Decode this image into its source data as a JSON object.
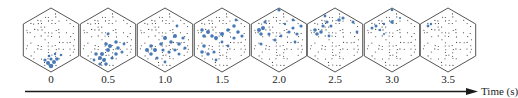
{
  "figure": {
    "axis": {
      "label": "Time (s)",
      "arrow_color": "#1a1a1a"
    },
    "colors": {
      "hex_outline": "#555555",
      "grid_dot": "#333333",
      "activation": "#3a6fb0"
    },
    "frames": [
      {
        "time_label": "0",
        "cx": 51,
        "blobs": [
          [
            0,
            26,
            2.2
          ],
          [
            -3,
            23,
            2
          ],
          [
            3,
            22,
            2
          ],
          [
            -6,
            20,
            1.6
          ],
          [
            6,
            19,
            1.8
          ],
          [
            0,
            19,
            1.6
          ],
          [
            -2,
            16,
            1.3
          ],
          [
            10,
            15,
            1.3
          ],
          [
            4,
            14,
            1.2
          ]
        ]
      },
      {
        "time_label": "0.5",
        "cx": 108,
        "blobs": [
          [
            -8,
            18,
            2
          ],
          [
            -4,
            20,
            2
          ],
          [
            -12,
            14,
            1.8
          ],
          [
            -6,
            14,
            2
          ],
          [
            0,
            10,
            2
          ],
          [
            2,
            6,
            2
          ],
          [
            -2,
            4,
            1.8
          ],
          [
            8,
            2,
            1.8
          ],
          [
            10,
            8,
            1.8
          ],
          [
            8,
            14,
            1.8
          ],
          [
            14,
            12,
            1.5
          ],
          [
            4,
            18,
            1.6
          ],
          [
            -2,
            24,
            1.8
          ],
          [
            -8,
            24,
            1.6
          ],
          [
            0,
            -6,
            1.4
          ],
          [
            -14,
            20,
            1.4
          ],
          [
            16,
            4,
            1.4
          ]
        ]
      },
      {
        "time_label": "1.0",
        "cx": 165,
        "blobs": [
          [
            -18,
            10,
            2
          ],
          [
            -14,
            6,
            1.8
          ],
          [
            -10,
            10,
            2
          ],
          [
            -14,
            14,
            1.8
          ],
          [
            -8,
            18,
            1.6
          ],
          [
            -4,
            4,
            1.8
          ],
          [
            0,
            -2,
            2
          ],
          [
            6,
            2,
            1.8
          ],
          [
            10,
            -4,
            2
          ],
          [
            14,
            4,
            1.8
          ],
          [
            18,
            -2,
            1.6
          ],
          [
            10,
            10,
            1.6
          ],
          [
            4,
            12,
            1.6
          ],
          [
            -2,
            10,
            1.6
          ],
          [
            14,
            14,
            1.5
          ],
          [
            0,
            22,
            1.4
          ],
          [
            12,
            -14,
            1.4
          ],
          [
            20,
            8,
            1.6
          ]
        ]
      },
      {
        "time_label": "1.5",
        "cx": 222,
        "blobs": [
          [
            -20,
            -10,
            1.8
          ],
          [
            -18,
            -4,
            1.8
          ],
          [
            -14,
            -8,
            2
          ],
          [
            -10,
            -4,
            1.8
          ],
          [
            -6,
            -2,
            2
          ],
          [
            0,
            -6,
            2
          ],
          [
            6,
            -10,
            1.8
          ],
          [
            12,
            -14,
            1.8
          ],
          [
            16,
            -8,
            1.8
          ],
          [
            20,
            -4,
            1.6
          ],
          [
            12,
            -2,
            1.6
          ],
          [
            -18,
            6,
            1.8
          ],
          [
            -20,
            12,
            1.8
          ],
          [
            -14,
            14,
            1.8
          ],
          [
            -8,
            12,
            1.6
          ],
          [
            -6,
            20,
            1.4
          ],
          [
            0,
            2,
            1.4
          ],
          [
            6,
            6,
            1.4
          ],
          [
            14,
            -20,
            1.4
          ]
        ]
      },
      {
        "time_label": "2.0",
        "cx": 279,
        "blobs": [
          [
            -20,
            -10,
            2
          ],
          [
            -16,
            -12,
            2
          ],
          [
            -18,
            -6,
            1.8
          ],
          [
            -14,
            -18,
            1.6
          ],
          [
            -10,
            -6,
            1.6
          ],
          [
            -4,
            0,
            1.6
          ],
          [
            -18,
            4,
            1.5
          ],
          [
            2,
            -4,
            1.4
          ],
          [
            10,
            -8,
            1.6
          ],
          [
            14,
            -12,
            1.6
          ],
          [
            18,
            -6,
            1.6
          ],
          [
            22,
            -14,
            1.6
          ],
          [
            14,
            -20,
            1.4
          ],
          [
            16,
            2,
            1.4
          ],
          [
            0,
            -30,
            1.6
          ],
          [
            6,
            -16,
            1.2
          ]
        ]
      },
      {
        "time_label": "2.5",
        "cx": 335,
        "blobs": [
          [
            -20,
            -10,
            1.8
          ],
          [
            -18,
            -6,
            1.8
          ],
          [
            -14,
            -8,
            1.8
          ],
          [
            -12,
            -14,
            1.6
          ],
          [
            -8,
            -18,
            1.6
          ],
          [
            -4,
            -14,
            1.5
          ],
          [
            4,
            -20,
            1.8
          ],
          [
            8,
            -22,
            1.6
          ],
          [
            -6,
            -4,
            1.4
          ],
          [
            18,
            -18,
            1.5
          ],
          [
            22,
            -8,
            1.4
          ],
          [
            -10,
            -24,
            1.4
          ]
        ]
      },
      {
        "time_label": "3.0",
        "cx": 392,
        "blobs": [
          [
            -20,
            -12,
            1.5
          ],
          [
            -16,
            -14,
            1.5
          ],
          [
            -12,
            -10,
            1.2
          ],
          [
            -8,
            -16,
            1.2
          ],
          [
            0,
            -18,
            1.8
          ],
          [
            0,
            -30,
            1.3
          ],
          [
            -8,
            -6,
            1.1
          ],
          [
            8,
            -22,
            1.1
          ]
        ]
      },
      {
        "time_label": "3.5",
        "cx": 448,
        "blobs": [
          [
            -20,
            -14,
            1.4
          ],
          [
            -17,
            -16,
            1.2
          ]
        ]
      }
    ]
  }
}
